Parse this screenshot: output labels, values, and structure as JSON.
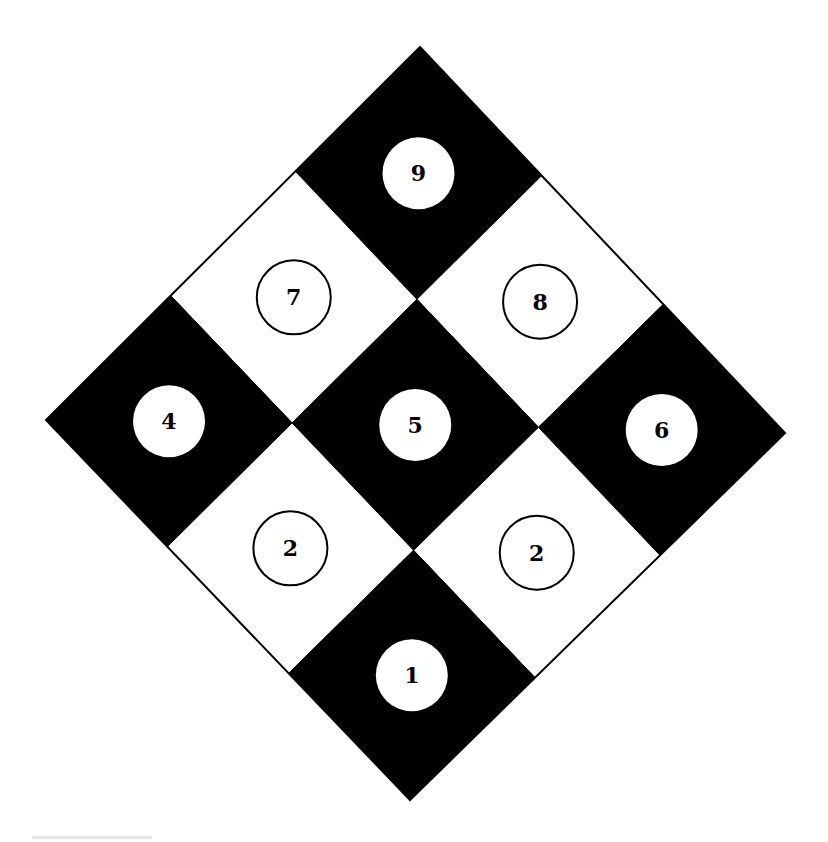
{
  "diagram": {
    "type": "rotated-3x3-checker-grid",
    "background_color": "#ffffff",
    "dark_color": "#000000",
    "light_color": "#ffffff",
    "outer_vertices": {
      "top": [
        420,
        47
      ],
      "left": [
        46,
        420
      ],
      "right": [
        785,
        433
      ],
      "bottom": [
        410,
        800
      ]
    },
    "cells": [
      {
        "row": 0,
        "col": 0,
        "label": "9",
        "shade": "dark",
        "marker": "filled-circle"
      },
      {
        "row": 0,
        "col": 1,
        "label": "8",
        "shade": "light",
        "marker": "outlined-circle"
      },
      {
        "row": 0,
        "col": 2,
        "label": "6",
        "shade": "dark",
        "marker": "filled-circle"
      },
      {
        "row": 1,
        "col": 0,
        "label": "7",
        "shade": "light",
        "marker": "outlined-circle"
      },
      {
        "row": 1,
        "col": 1,
        "label": "5",
        "shade": "dark",
        "marker": "filled-circle"
      },
      {
        "row": 1,
        "col": 2,
        "label": "2",
        "shade": "light",
        "marker": "outlined-circle"
      },
      {
        "row": 2,
        "col": 0,
        "label": "4",
        "shade": "dark",
        "marker": "filled-circle"
      },
      {
        "row": 2,
        "col": 1,
        "label": "2",
        "shade": "light",
        "marker": "outlined-circle"
      },
      {
        "row": 2,
        "col": 2,
        "label": "1",
        "shade": "dark",
        "marker": "filled-circle"
      }
    ],
    "circle_radius_dark": 36,
    "circle_radius_light": 37
  }
}
